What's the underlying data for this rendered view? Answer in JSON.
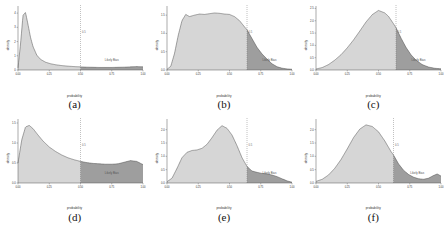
{
  "figure": {
    "layout": "2x3 grid of density plots",
    "panels_order": [
      "a",
      "b",
      "c",
      "d",
      "e",
      "f"
    ]
  },
  "common": {
    "xlabel": "probability",
    "ylabel": "density",
    "xticks": [
      "0.00",
      "0.25",
      "0.50",
      "0.75",
      "1.00"
    ],
    "bias_annotation": "Likely Bias",
    "threshold_label": "0.5",
    "fill_light": "#d6d6d6",
    "fill_dark": "#9e9e9e",
    "line_color": "#4d4d4d",
    "axis_color": "#555555",
    "threshold_color": "#777777"
  },
  "chart_data": [
    {
      "type": "area",
      "panel": "a",
      "caption": "(a)",
      "title": "",
      "xlabel": "probability",
      "ylabel": "density",
      "xlim": [
        0.0,
        1.0
      ],
      "ylim": [
        0.0,
        4.5
      ],
      "xticks": [
        0.0,
        0.25,
        0.5,
        0.75,
        1.0
      ],
      "yticks": [
        0,
        1,
        2,
        3,
        4
      ],
      "ytick_labels": [
        "0",
        "1",
        "2",
        "3",
        "4"
      ],
      "grid": false,
      "threshold": 0.5,
      "threshold_label": "0.5",
      "shaded_region_label": "Likely Bias",
      "shaded_region_from": 0.5,
      "shaded_region_to": 1.0,
      "x": [
        0.0,
        0.02,
        0.04,
        0.06,
        0.08,
        0.1,
        0.12,
        0.15,
        0.18,
        0.22,
        0.26,
        0.3,
        0.35,
        0.4,
        0.45,
        0.5,
        0.55,
        0.6,
        0.65,
        0.7,
        0.75,
        0.8,
        0.85,
        0.9,
        0.95,
        1.0
      ],
      "y": [
        0.15,
        1.8,
        3.85,
        4.05,
        3.2,
        2.3,
        1.65,
        1.05,
        0.75,
        0.55,
        0.44,
        0.37,
        0.31,
        0.27,
        0.24,
        0.22,
        0.2,
        0.19,
        0.18,
        0.18,
        0.18,
        0.19,
        0.2,
        0.22,
        0.24,
        0.22
      ]
    },
    {
      "type": "area",
      "panel": "b",
      "caption": "(b)",
      "title": "",
      "xlabel": "probability",
      "ylabel": "density",
      "xlim": [
        0.0,
        1.0
      ],
      "ylim": [
        0.0,
        1.75
      ],
      "xticks": [
        0.0,
        0.25,
        0.5,
        0.75,
        1.0
      ],
      "yticks": [
        0.0,
        0.5,
        1.0,
        1.5
      ],
      "ytick_labels": [
        "0.0",
        "0.5",
        "1.0",
        "1.5"
      ],
      "grid": false,
      "threshold": 0.64,
      "threshold_label": "0.5",
      "shaded_region_label": "Likely Bias",
      "shaded_region_from": 0.64,
      "shaded_region_to": 1.0,
      "x": [
        0.0,
        0.03,
        0.06,
        0.09,
        0.12,
        0.15,
        0.18,
        0.22,
        0.26,
        0.3,
        0.34,
        0.38,
        0.42,
        0.46,
        0.5,
        0.54,
        0.58,
        0.62,
        0.64,
        0.68,
        0.72,
        0.76,
        0.8,
        0.84,
        0.88,
        0.92,
        0.96,
        1.0
      ],
      "y": [
        0.02,
        0.1,
        0.45,
        0.95,
        1.35,
        1.52,
        1.46,
        1.5,
        1.53,
        1.52,
        1.54,
        1.56,
        1.55,
        1.53,
        1.52,
        1.46,
        1.35,
        1.18,
        1.1,
        0.86,
        0.62,
        0.44,
        0.3,
        0.17,
        0.09,
        0.05,
        0.03,
        0.02
      ]
    },
    {
      "type": "area",
      "panel": "c",
      "caption": "(c)",
      "title": "",
      "xlabel": "probability",
      "ylabel": "density",
      "xlim": [
        0.0,
        1.0
      ],
      "ylim": [
        0.0,
        2.6
      ],
      "xticks": [
        0.0,
        0.25,
        0.5,
        0.75,
        1.0
      ],
      "yticks": [
        0.0,
        0.5,
        1.0,
        1.5,
        2.0,
        2.5
      ],
      "ytick_labels": [
        "0.0",
        "0.5",
        "1.0",
        "1.5",
        "2.0",
        "2.5"
      ],
      "grid": false,
      "threshold": 0.64,
      "threshold_label": "0.5",
      "shaded_region_label": "Likely Bias",
      "shaded_region_from": 0.64,
      "shaded_region_to": 1.0,
      "x": [
        0.0,
        0.05,
        0.1,
        0.15,
        0.2,
        0.25,
        0.3,
        0.35,
        0.4,
        0.45,
        0.5,
        0.55,
        0.58,
        0.62,
        0.64,
        0.68,
        0.72,
        0.76,
        0.8,
        0.85,
        0.9,
        0.95,
        1.0
      ],
      "y": [
        0.04,
        0.1,
        0.22,
        0.4,
        0.62,
        0.9,
        1.22,
        1.58,
        1.95,
        2.25,
        2.42,
        2.32,
        2.18,
        1.88,
        1.72,
        1.3,
        0.92,
        0.62,
        0.4,
        0.22,
        0.12,
        0.07,
        0.05
      ]
    },
    {
      "type": "area",
      "panel": "d",
      "caption": "(d)",
      "title": "",
      "xlabel": "probability",
      "ylabel": "density",
      "xlim": [
        0.0,
        1.0
      ],
      "ylim": [
        0.0,
        1.6
      ],
      "xticks": [
        0.0,
        0.25,
        0.5,
        0.75,
        1.0
      ],
      "yticks": [
        0.0,
        0.5,
        1.0,
        1.5
      ],
      "ytick_labels": [
        "0.0",
        "0.5",
        "1.0",
        "1.5"
      ],
      "grid": false,
      "threshold": 0.5,
      "threshold_label": "0.5",
      "shaded_region_label": "Likely Bias",
      "shaded_region_from": 0.5,
      "shaded_region_to": 1.0,
      "x": [
        0.0,
        0.03,
        0.06,
        0.09,
        0.12,
        0.16,
        0.2,
        0.25,
        0.3,
        0.35,
        0.4,
        0.45,
        0.5,
        0.55,
        0.6,
        0.65,
        0.7,
        0.75,
        0.8,
        0.85,
        0.9,
        0.95,
        1.0
      ],
      "y": [
        0.5,
        1.08,
        1.4,
        1.44,
        1.36,
        1.2,
        1.05,
        0.9,
        0.79,
        0.7,
        0.63,
        0.58,
        0.54,
        0.51,
        0.49,
        0.48,
        0.47,
        0.47,
        0.48,
        0.52,
        0.56,
        0.54,
        0.46
      ]
    },
    {
      "type": "area",
      "panel": "e",
      "caption": "(e)",
      "title": "",
      "xlabel": "probability",
      "ylabel": "density",
      "xlim": [
        0.0,
        1.0
      ],
      "ylim": [
        0.0,
        2.4
      ],
      "xticks": [
        0.0,
        0.25,
        0.5,
        0.75,
        1.0
      ],
      "yticks": [
        0.0,
        0.5,
        1.0,
        1.5,
        2.0
      ],
      "ytick_labels": [
        "0.0",
        "0.5",
        "1.0",
        "1.5",
        "2.0"
      ],
      "grid": false,
      "threshold": 0.64,
      "threshold_label": "0.5",
      "shaded_region_label": "Likely Bias",
      "shaded_region_from": 0.64,
      "shaded_region_to": 1.0,
      "x": [
        0.0,
        0.04,
        0.08,
        0.12,
        0.16,
        0.2,
        0.24,
        0.28,
        0.32,
        0.36,
        0.4,
        0.44,
        0.48,
        0.52,
        0.56,
        0.6,
        0.64,
        0.68,
        0.72,
        0.76,
        0.8,
        0.84,
        0.88,
        0.92,
        0.96,
        1.0
      ],
      "y": [
        0.05,
        0.18,
        0.55,
        0.95,
        1.15,
        1.22,
        1.24,
        1.3,
        1.45,
        1.7,
        1.98,
        2.15,
        2.05,
        1.8,
        1.4,
        0.95,
        0.62,
        0.45,
        0.4,
        0.36,
        0.34,
        0.3,
        0.24,
        0.16,
        0.08,
        0.03
      ]
    },
    {
      "type": "area",
      "panel": "f",
      "caption": "(f)",
      "title": "",
      "xlabel": "probability",
      "ylabel": "density",
      "xlim": [
        0.0,
        1.0
      ],
      "ylim": [
        0.0,
        2.4
      ],
      "xticks": [
        0.0,
        0.25,
        0.5,
        0.75,
        1.0
      ],
      "yticks": [
        0.0,
        0.5,
        1.0,
        1.5,
        2.0
      ],
      "ytick_labels": [
        "0.0",
        "0.5",
        "1.0",
        "1.5",
        "2.0"
      ],
      "grid": false,
      "threshold": 0.62,
      "threshold_label": "0.5",
      "shaded_region_label": "Likely Bias",
      "shaded_region_from": 0.62,
      "shaded_region_to": 1.0,
      "x": [
        0.0,
        0.05,
        0.1,
        0.15,
        0.2,
        0.25,
        0.3,
        0.35,
        0.4,
        0.45,
        0.5,
        0.55,
        0.6,
        0.62,
        0.66,
        0.7,
        0.74,
        0.78,
        0.82,
        0.86,
        0.9,
        0.94,
        0.97,
        1.0
      ],
      "y": [
        0.06,
        0.14,
        0.3,
        0.55,
        0.88,
        1.28,
        1.7,
        2.02,
        2.18,
        2.12,
        1.92,
        1.58,
        1.18,
        1.05,
        0.72,
        0.48,
        0.32,
        0.22,
        0.16,
        0.14,
        0.18,
        0.28,
        0.34,
        0.26
      ]
    }
  ]
}
